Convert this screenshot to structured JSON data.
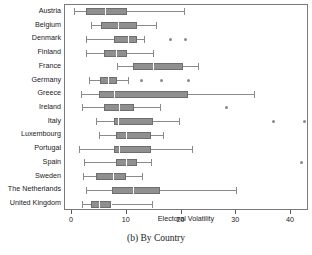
{
  "figure": {
    "caption": "(b)  By Country",
    "x_title": "Electoral Volatility"
  },
  "axis": {
    "ticks": [
      0,
      10,
      20,
      30,
      40
    ],
    "tick_labels": [
      "0",
      "10",
      "20",
      "30",
      "40"
    ],
    "xlim": [
      -1.3,
      43.3
    ]
  },
  "colors": {
    "box_fill": "#8f8f8f",
    "box_edge": "#6e6e6e",
    "whisker": "#8a8a8a",
    "median": "#ffffff",
    "frame": "#7a7a7a",
    "text": "#1a1a1a"
  },
  "chart_data": {
    "type": "box",
    "title": "(b)  By Country",
    "xlabel": "Electoral Volatility",
    "ylabel": "",
    "xlim": [
      -1.3,
      43.3
    ],
    "grid": false,
    "legend": "none",
    "orientation": "horizontal",
    "categories": [
      "Austria",
      "Belgium",
      "Denmark",
      "Finland",
      "France",
      "Germany",
      "Greece",
      "Ireland",
      "Italy",
      "Luxembourg",
      "Portugal",
      "Spain",
      "Sweden",
      "The Netherlands",
      "United Kingdom"
    ],
    "boxes": [
      {
        "label": "Austria",
        "whisker_low": 0.4,
        "q1": 2.5,
        "median": 6.0,
        "q3": 10.0,
        "whisker_high": 20.5,
        "outliers": []
      },
      {
        "label": "Belgium",
        "whisker_low": 3.5,
        "q1": 5.3,
        "median": 8.4,
        "q3": 11.9,
        "whisker_high": 15.3,
        "outliers": []
      },
      {
        "label": "Denmark",
        "whisker_low": 2.5,
        "q1": 7.7,
        "median": 10.2,
        "q3": 11.9,
        "whisker_high": 13.2,
        "outliers": [
          17.9,
          20.8
        ]
      },
      {
        "label": "Finland",
        "whisker_low": 2.5,
        "q1": 5.9,
        "median": 8.0,
        "q3": 10.1,
        "whisker_high": 14.8,
        "outliers": []
      },
      {
        "label": "France",
        "whisker_low": 8.2,
        "q1": 11.2,
        "median": 14.8,
        "q3": 20.3,
        "whisker_high": 23.0,
        "outliers": []
      },
      {
        "label": "Germany",
        "whisker_low": 3.1,
        "q1": 5.1,
        "median": 6.5,
        "q3": 8.2,
        "whisker_high": 10.2,
        "outliers": [
          12.6,
          16.3,
          21.2
        ]
      },
      {
        "label": "Greece",
        "whisker_low": 1.6,
        "q1": 4.9,
        "median": 7.7,
        "q3": 21.2,
        "whisker_high": 33.3,
        "outliers": []
      },
      {
        "label": "Ireland",
        "whisker_low": 1.8,
        "q1": 5.9,
        "median": 8.6,
        "q3": 11.4,
        "whisker_high": 16.1,
        "outliers": [
          28.3
        ]
      },
      {
        "label": "Italy",
        "whisker_low": 4.3,
        "q1": 7.6,
        "median": 8.3,
        "q3": 14.7,
        "whisker_high": 19.5,
        "outliers": [
          36.8,
          42.4
        ]
      },
      {
        "label": "Luxembourg",
        "whisker_low": 5.0,
        "q1": 8.0,
        "median": 9.8,
        "q3": 14.4,
        "whisker_high": 16.6,
        "outliers": []
      },
      {
        "label": "Portugal",
        "whisker_low": 1.3,
        "q1": 7.6,
        "median": 8.6,
        "q3": 14.5,
        "whisker_high": 22.0,
        "outliers": []
      },
      {
        "label": "Spain",
        "whisker_low": 2.2,
        "q1": 8.0,
        "median": 9.8,
        "q3": 11.8,
        "whisker_high": 14.5,
        "outliers": [
          42.0
        ]
      },
      {
        "label": "Sweden",
        "whisker_low": 2.0,
        "q1": 4.3,
        "median": 7.4,
        "q3": 9.9,
        "whisker_high": 12.7,
        "outliers": []
      },
      {
        "label": "The Netherlands",
        "whisker_low": 2.6,
        "q1": 7.3,
        "median": 11.2,
        "q3": 16.0,
        "whisker_high": 30.0,
        "outliers": []
      },
      {
        "label": "United Kingdom",
        "whisker_low": 1.8,
        "q1": 3.4,
        "median": 5.0,
        "q3": 7.2,
        "whisker_high": 14.6,
        "outliers": []
      }
    ]
  }
}
